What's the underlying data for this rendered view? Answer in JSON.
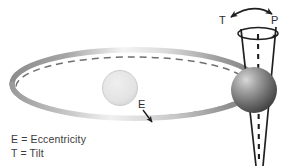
{
  "diagram": {
    "labels": {
      "eccentricity_symbol": "E",
      "tilt_symbol": "T",
      "precession_symbol": "P"
    },
    "legend": {
      "line1": "E = Eccentricity",
      "line2": "T = Tilt"
    },
    "elements": {
      "orbit_band_name": "elliptical orbit band",
      "orbit_dashed_name": "dashed reference orbit",
      "sun_name": "sun",
      "planet_name": "planet sphere",
      "cone_name": "precession cone",
      "axis_name": "rotation axis"
    },
    "colors": {
      "background": "#ffffff",
      "orbit_dark": "#8d8d8d",
      "orbit_light": "#f2f2f2",
      "dashed_stroke": "#6f6f6f",
      "sun_fill": "#e2e2e2",
      "sun_stroke": "#c4c4c4",
      "planet_dark": "#4a4a4a",
      "planet_light": "#cfcfcf",
      "line_stroke": "#1f1f1f",
      "text": "#3b3b3b"
    }
  }
}
